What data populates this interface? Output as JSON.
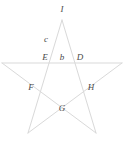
{
  "figure": {
    "background_color": "#ffffff",
    "line_color": "#d9d9d9",
    "label_color": "#4a4a4a",
    "line_width": 1,
    "canvas": {
      "width": 124,
      "height": 141
    }
  },
  "labels": [
    {
      "id": "label-I",
      "text": "I",
      "x": 62,
      "y": 9
    },
    {
      "id": "label-c",
      "text": "c",
      "x": 46,
      "y": 39
    },
    {
      "id": "label-E",
      "text": "E",
      "x": 45,
      "y": 57
    },
    {
      "id": "label-b",
      "text": "b",
      "x": 62,
      "y": 57
    },
    {
      "id": "label-D",
      "text": "D",
      "x": 80,
      "y": 57
    },
    {
      "id": "label-F",
      "text": "F",
      "x": 31,
      "y": 87
    },
    {
      "id": "label-H",
      "text": "H",
      "x": 91,
      "y": 87
    },
    {
      "id": "label-G",
      "text": "G",
      "x": 62,
      "y": 108
    }
  ],
  "star": {
    "points": [
      {
        "name": "apex-top",
        "x": 62,
        "y": 20
      },
      {
        "name": "point-right",
        "x": 122,
        "y": 63
      },
      {
        "name": "point-bottom-right",
        "x": 96,
        "y": 133
      },
      {
        "name": "point-bottom-left",
        "x": 28,
        "y": 133
      },
      {
        "name": "point-left",
        "x": 2,
        "y": 63
      }
    ],
    "edges": [
      {
        "name": "edge-apex-to-bottom-right",
        "from": 0,
        "to": 2
      },
      {
        "name": "edge-bottom-right-to-left",
        "from": 2,
        "to": 4
      },
      {
        "name": "edge-left-to-right",
        "from": 4,
        "to": 1
      },
      {
        "name": "edge-right-to-bottom-left",
        "from": 1,
        "to": 3
      },
      {
        "name": "edge-bottom-left-to-apex",
        "from": 3,
        "to": 0
      }
    ]
  }
}
